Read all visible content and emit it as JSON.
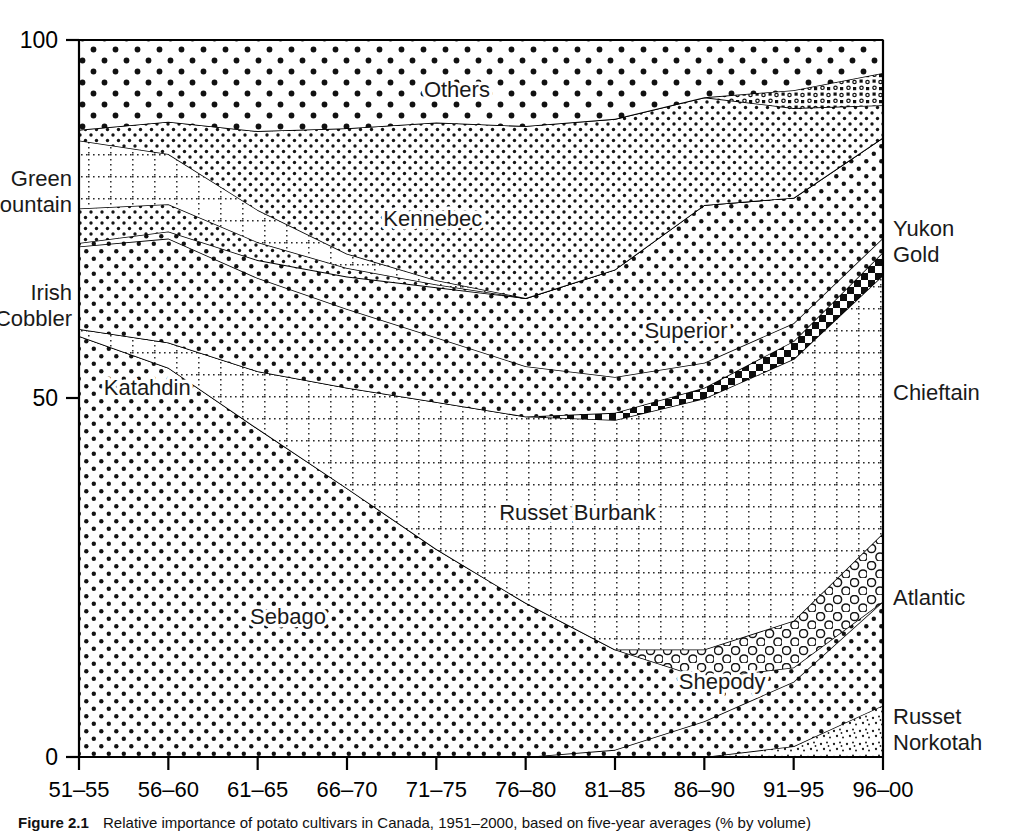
{
  "figure": {
    "caption_label": "Figure 2.1",
    "caption_text": "Relative importance of potato cultivars in Canada, 1951–2000, based on five-year averages (% by volume)"
  },
  "chart_data": {
    "type": "area",
    "title": "",
    "subtitle": "",
    "xlabel": "",
    "ylabel": "",
    "stacked": true,
    "stack_order": "bottom-to-top",
    "grid": false,
    "legend": "inline-annotations",
    "ylim": [
      0,
      100
    ],
    "yticks": [
      0,
      50,
      100
    ],
    "ytick_labels": [
      "0",
      "50",
      "100"
    ],
    "categories": [
      "51–55",
      "56–60",
      "61–65",
      "66–70",
      "71–75",
      "76–80",
      "81–85",
      "86–90",
      "91–95",
      "96–00"
    ],
    "series": [
      {
        "name": "Russet Norkotah",
        "label_position": "right-outside",
        "fill": "fine-speckle",
        "values": [
          0,
          0,
          0,
          0,
          0,
          0,
          0,
          0,
          1.5,
          7.2
        ]
      },
      {
        "name": "Shepody",
        "label_position": "inside",
        "fill": "medium-dots",
        "values": [
          0,
          0,
          0,
          0,
          0,
          0,
          1.0,
          5.0,
          9.0,
          14.5
        ]
      },
      {
        "name": "Sebago",
        "label_position": "inside",
        "fill": "medium-dots",
        "values": [
          58.7,
          54.3,
          45.8,
          37.5,
          29.0,
          21.5,
          14.0,
          6.0,
          2.0,
          0.0
        ]
      },
      {
        "name": "Atlantic",
        "label_position": "right-outside",
        "fill": "open-circles",
        "values": [
          0,
          0,
          0,
          0,
          0,
          0,
          0,
          4.0,
          6.5,
          9.5
        ]
      },
      {
        "name": "Russet Burbank",
        "label_position": "inside",
        "fill": "dotted-grid",
        "values": [
          1.0,
          3.5,
          8.0,
          14.0,
          20.5,
          26.0,
          32.0,
          35.0,
          36.5,
          36.0
        ]
      },
      {
        "name": "Chieftain",
        "label_position": "right-outside",
        "fill": "checkerboard",
        "values": [
          0,
          0,
          0,
          0,
          0,
          0,
          1.0,
          1.5,
          2.5,
          3.2
        ]
      },
      {
        "name": "Katahdin",
        "label_position": "inside",
        "fill": "medium-dots",
        "values": [
          11.5,
          14.5,
          13.0,
          11.0,
          9.0,
          7.0,
          5.0,
          3.5,
          2.5,
          2.0
        ]
      },
      {
        "name": "Superior",
        "label_position": "inside",
        "fill": "medium-dots",
        "values": [
          0.5,
          1.0,
          2.5,
          4.5,
          7.0,
          9.5,
          15.0,
          22.0,
          17.5,
          14.0
        ]
      },
      {
        "name": "Irish Cobbler",
        "label_position": "left-outside",
        "fill": "fine-dots",
        "values": [
          4.8,
          3.8,
          2.5,
          1.2,
          0.4,
          0.0,
          0.0,
          0.0,
          0.0,
          0.0
        ]
      },
      {
        "name": "Green Mountain",
        "label_position": "left-outside",
        "fill": "dotted-grid",
        "values": [
          9.5,
          7.0,
          4.5,
          2.0,
          0.6,
          0.0,
          0.0,
          0.0,
          0.0,
          0.0
        ]
      },
      {
        "name": "Kennebec",
        "label_position": "inside",
        "fill": "fine-dots",
        "values": [
          1.5,
          4.5,
          11.0,
          17.5,
          22.0,
          24.0,
          21.0,
          15.0,
          12.5,
          4.5
        ]
      },
      {
        "name": "Yukon Gold",
        "label_position": "right-outside",
        "fill": "mixed-speckle",
        "values": [
          0,
          0,
          0,
          0,
          0,
          0,
          0,
          0,
          2.5,
          4.5
        ]
      },
      {
        "name": "Others",
        "label_position": "inside",
        "fill": "coarse-dots",
        "values": [
          12.5,
          11.4,
          12.7,
          12.3,
          11.5,
          12.0,
          11.0,
          8.0,
          7.0,
          4.6
        ]
      }
    ],
    "annotations": [
      {
        "text": "Others",
        "x_frac": 0.47,
        "value_frac": 0.92
      },
      {
        "text": "Kennebec",
        "x_frac": 0.44,
        "value_frac": 0.74
      },
      {
        "text": "Superior",
        "x_frac": 0.755,
        "value_frac": 0.585
      },
      {
        "text": "Katahdin",
        "x_frac": 0.085,
        "value_frac": 0.505
      },
      {
        "text": "Russet Burbank",
        "x_frac": 0.62,
        "value_frac": 0.33
      },
      {
        "text": "Sebago",
        "x_frac": 0.26,
        "value_frac": 0.185
      },
      {
        "text": "Shepody",
        "x_frac": 0.8,
        "value_frac": 0.095
      }
    ],
    "outside_labels": [
      {
        "text": "Green Mountain",
        "side": "left",
        "lines": [
          "Green",
          "Mountain"
        ]
      },
      {
        "text": "Irish Cobbler",
        "side": "left",
        "lines": [
          "Irish",
          "Cobbler"
        ]
      },
      {
        "text": "Yukon Gold",
        "side": "right",
        "lines": [
          "Yukon",
          "Gold"
        ]
      },
      {
        "text": "Chieftain",
        "side": "right",
        "lines": [
          "Chieftain"
        ]
      },
      {
        "text": "Atlantic",
        "side": "right",
        "lines": [
          "Atlantic"
        ]
      },
      {
        "text": "Russet Norkotah",
        "side": "right",
        "lines": [
          "Russet",
          "Norkotah"
        ]
      }
    ]
  },
  "axes": {
    "y_top_label": "100",
    "y_mid_label": "50",
    "y_zero_label": "0"
  },
  "colors": {
    "ink": "#000000",
    "background": "#ffffff",
    "pattern": "#1a1a1a"
  }
}
